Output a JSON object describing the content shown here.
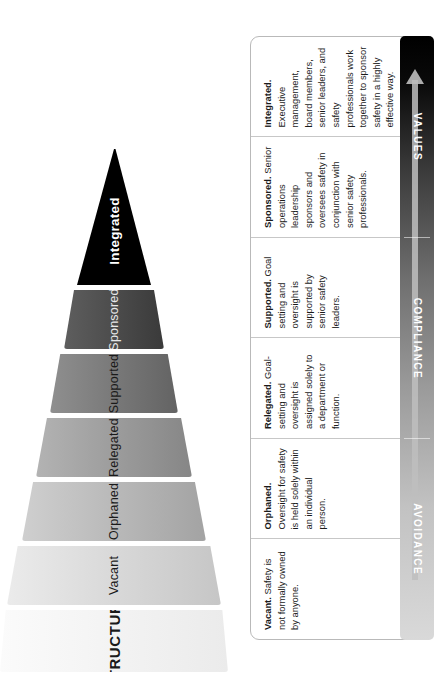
{
  "diagram": {
    "funnel": {
      "header_label": "STRUCTURE",
      "stages": [
        {
          "name": "Vacant",
          "color": "#d7d7d7"
        },
        {
          "name": "Orphaned",
          "color": "#bdbdbd"
        },
        {
          "name": "Relegated",
          "color": "#9b9b9b"
        },
        {
          "name": "Supported",
          "color": "#7a7a7a"
        },
        {
          "name": "Sponsored",
          "color": "#4e4e4e"
        },
        {
          "name": "Integrated",
          "color": "#000000"
        }
      ]
    },
    "descriptions": [
      {
        "term": "Vacant.",
        "text": " Safety is not formally owned by anyone."
      },
      {
        "term": "Orphaned.",
        "text": " Oversight for safety is held solely within an individual person."
      },
      {
        "term": "Relegated.",
        "text": " Goal-setting and oversight is assigned solely to a department or function."
      },
      {
        "term": "Supported.",
        "text": " Goal setting and oversight is supported by senior safety leaders."
      },
      {
        "term": "Sponsored.",
        "text": " Senior operations leadership sponsors and oversees safety in conjunction with senior safety professionals."
      },
      {
        "term": "Integrated.",
        "text": " Executive management, board members, senior leaders, and safety professionals work together to sponsor safety in a highly effective way."
      }
    ],
    "maturity_bar": {
      "segments": [
        "AVOIDANCE",
        "COMPLIANCE",
        "VALUES"
      ],
      "arrow_direction": "right",
      "gradient_from": "#d9d9d9",
      "gradient_to": "#000000"
    }
  }
}
